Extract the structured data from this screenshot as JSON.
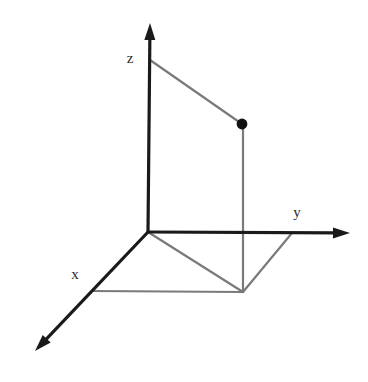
{
  "figure": {
    "background_color": "#ffffff",
    "width": 368,
    "height": 382
  },
  "style": {
    "axis_color": "#1a1a1a",
    "axis_width": 3.2,
    "projection_color": "#7a7a7a",
    "projection_width": 2.2,
    "point_color": "#111111",
    "point_radius": 5.4,
    "label_color": "#2b2b2b",
    "label_font_size": "15px"
  },
  "axes": {
    "origin": {
      "x": 148,
      "y": 232
    },
    "items": [
      {
        "name": "z",
        "label": "z",
        "label_x": 130,
        "label_y": 58,
        "from_x": 148,
        "from_y": 232,
        "to_x": 150,
        "to_y": 23,
        "arrowhead": true
      },
      {
        "name": "y",
        "label": "y",
        "label_x": 297,
        "label_y": 212,
        "from_x": 148,
        "from_y": 232,
        "to_x": 350,
        "to_y": 233,
        "arrowhead": true
      },
      {
        "name": "x",
        "label": "x",
        "label_x": 75,
        "label_y": 274,
        "from_x": 148,
        "from_y": 232,
        "to_x": 35,
        "to_y": 351,
        "arrowhead": true
      }
    ]
  },
  "point": {
    "name": "plotted-point",
    "x": 242,
    "y": 124,
    "radius": 5.4,
    "color": "#111111"
  },
  "projection_lines": [
    {
      "name": "z-height-line",
      "description": "from z-axis across to the point",
      "x1": 150,
      "y1": 60,
      "x2": 242,
      "y2": 124
    },
    {
      "name": "vertical-drop-line",
      "description": "from the point straight down to the xy-plane",
      "x1": 243,
      "y1": 124,
      "x2": 243,
      "y2": 292
    },
    {
      "name": "origin-to-foot-line",
      "description": "from origin diagonally to the foot of the perpendicular",
      "x1": 148,
      "y1": 232,
      "x2": 243,
      "y2": 292
    },
    {
      "name": "x-projection-line",
      "description": "from the x-axis horizontally to the foot of the perpendicular",
      "x1": 92,
      "y1": 291,
      "x2": 243,
      "y2": 292
    },
    {
      "name": "y-projection-line",
      "description": "from the foot of the perpendicular up to the y-axis",
      "x1": 243,
      "y1": 292,
      "x2": 292,
      "y2": 233
    }
  ],
  "chart_data": {
    "type": "scatter",
    "xlabel": "x",
    "ylabel": "y",
    "zlabel": "z",
    "grid": false,
    "legend": null,
    "axis_labels": [
      "x",
      "y",
      "z"
    ],
    "points": [
      {
        "label": "",
        "screen_x": 242,
        "screen_y": 124,
        "projection_foot_screen_x": 243,
        "projection_foot_screen_y": 292
      }
    ],
    "annotations": [
      "dashed-free guide lines show the point's projections onto the z-axis, the x-axis and the y-axis",
      "foot of perpendicular lies in the xy-plane"
    ]
  }
}
